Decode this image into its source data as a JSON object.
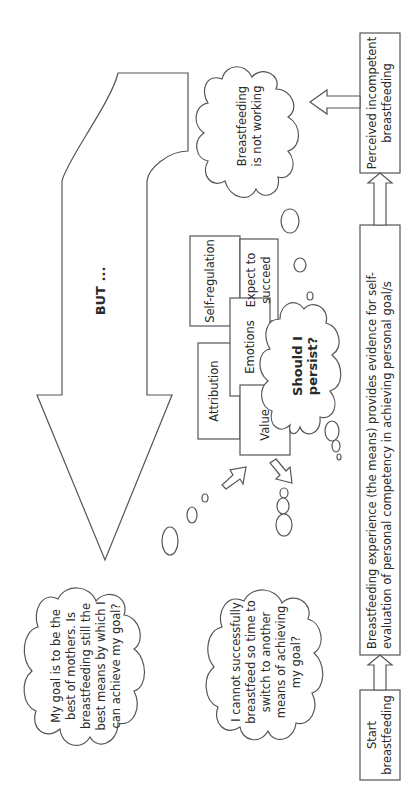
{
  "diagram": {
    "orientation": "rotated 90 degrees counter-clockwise",
    "colors": {
      "stroke": "#555555",
      "fill": "#ffffff",
      "text": "#2a2a2a"
    },
    "flow_boxes": {
      "start": "Start breastfeeding",
      "experience": "Breastfeeding experience (the means) provides evidence for self-evaluation of personal competency in achieving personal goal/s",
      "perceived": "Perceived incompetent breastfeeding"
    },
    "clouds": {
      "not_working": "Breastfeeding is not working",
      "should_persist": "Should I persist?",
      "goal": "My goal is to be the best of mothers. Is breastfeeding still the best means by which I can achieve my goal?",
      "switch": "I cannot successfully breastfeed so time to switch to another means of achieving my goal?"
    },
    "factor_boxes": {
      "attribution": "Attribution",
      "value": "Value",
      "emotions": "Emotions",
      "self_regulation": "Self-regulation",
      "expect": "Expect to succeed"
    },
    "big_arrow_label": "BUT ..."
  }
}
